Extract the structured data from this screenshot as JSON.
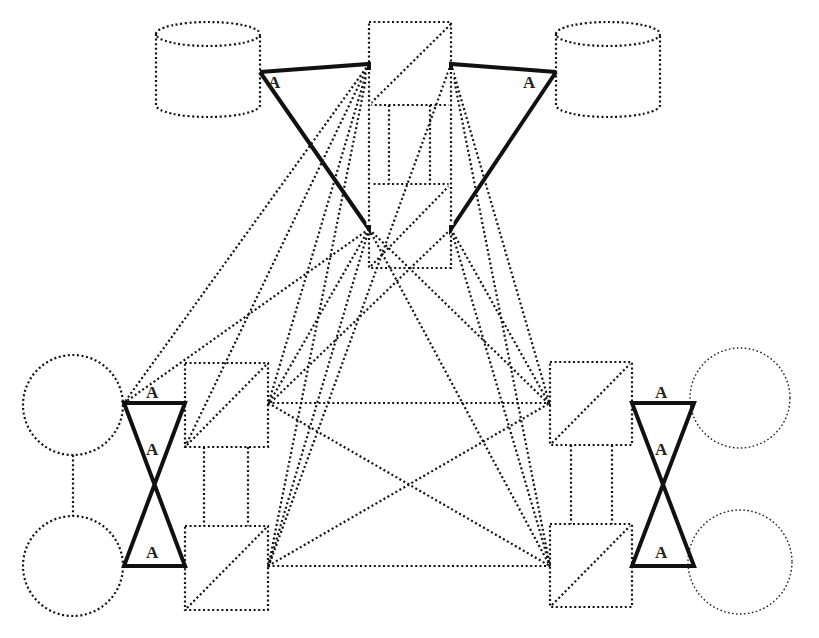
{
  "diagram": {
    "label": "A",
    "nodes": {
      "db_left": {
        "shape": "cylinder",
        "x": 156,
        "y": 22,
        "w": 104,
        "h": 95
      },
      "db_right": {
        "shape": "cylinder",
        "x": 556,
        "y": 22,
        "w": 104,
        "h": 95
      },
      "top_box_upper": {
        "shape": "box-split",
        "x": 369,
        "y": 22,
        "w": 82,
        "h": 83
      },
      "top_box_lower": {
        "shape": "box-split",
        "x": 369,
        "y": 184,
        "w": 82,
        "h": 84
      },
      "left_box_upper": {
        "shape": "box-split",
        "x": 185,
        "y": 363,
        "w": 83,
        "h": 84
      },
      "left_box_lower": {
        "shape": "box-split",
        "x": 185,
        "y": 526,
        "w": 83,
        "h": 84
      },
      "right_box_upper": {
        "shape": "box-split",
        "x": 550,
        "y": 362,
        "w": 82,
        "h": 83
      },
      "right_box_lower": {
        "shape": "box-split",
        "x": 550,
        "y": 524,
        "w": 82,
        "h": 83
      },
      "circle_left_upper": {
        "shape": "circle",
        "cx": 73,
        "cy": 405,
        "r": 50
      },
      "circle_left_lower": {
        "shape": "circle",
        "cx": 73,
        "cy": 566,
        "r": 50
      },
      "circle_right_upper": {
        "shape": "circle",
        "cx": 740,
        "cy": 398,
        "r": 50
      },
      "circle_right_lower": {
        "shape": "circle",
        "cx": 740,
        "cy": 562,
        "r": 52
      }
    },
    "a_labels": [
      "A",
      "A",
      "A",
      "A",
      "A",
      "A",
      "A",
      "A"
    ]
  }
}
